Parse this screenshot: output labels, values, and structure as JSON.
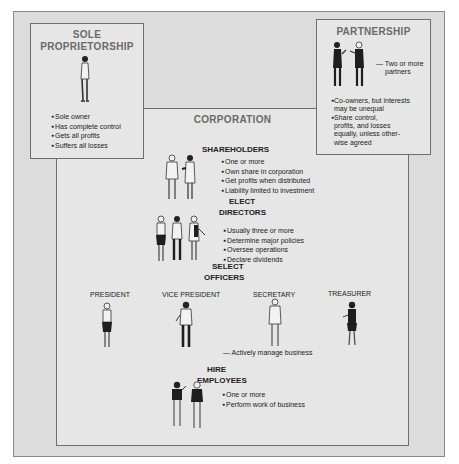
{
  "sole_proprietorship": {
    "title_line1": "SOLE",
    "title_line2": "PROPRIETORSHIP",
    "bullets": [
      "Sole owner",
      "Has complete control",
      "Gets all profits",
      "Suffers all losses"
    ]
  },
  "partnership": {
    "title": "PARTNERSHIP",
    "note_line1": "— Two or more",
    "note_line2": "partners",
    "bullets": [
      "Co-owners, but interests",
      "may be unequal",
      "Share control,",
      "profits, and losses",
      "equally, unless other-",
      "wise agreed"
    ]
  },
  "corporation": {
    "title": "CORPORATION",
    "shareholders": {
      "heading": "SHAREHOLDERS",
      "bullets": [
        "One or more",
        "Own share in corporation",
        "Get profits when distributed",
        "Liability limited to investment"
      ]
    },
    "elect": {
      "line1": "ELECT",
      "line2": "DIRECTORS"
    },
    "directors": {
      "bullets": [
        "Usually three or more",
        "Determine major policies",
        "Oversee operations",
        "Declare dividends"
      ]
    },
    "select": {
      "line1": "SELECT",
      "line2": "OFFICERS"
    },
    "officers": {
      "roles": [
        "PRESIDENT",
        "VICE PRESIDENT",
        "SECRETARY",
        "TREASURER"
      ],
      "note": "— Actively manage business"
    },
    "hire": {
      "line1": "HIRE",
      "line2": "EMPLOYEES"
    },
    "employees": {
      "bullets": [
        "One or more",
        "Perform work of business"
      ]
    }
  }
}
